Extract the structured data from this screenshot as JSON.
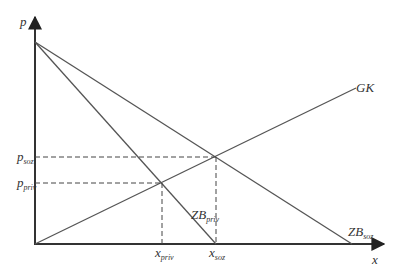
{
  "diagram": {
    "type": "supply-demand-externality",
    "colors": {
      "line": "#555555",
      "axis": "#333333",
      "dash": "#444444",
      "text": "#333333"
    },
    "axes": {
      "y": {
        "label": "p"
      },
      "x": {
        "label": "x"
      }
    },
    "curves": [
      {
        "id": "gk",
        "label": "GK",
        "description": "marginal cost / supply curve"
      },
      {
        "id": "zb_priv",
        "label": "ZB",
        "subscript": "priv",
        "description": "private marginal benefit"
      },
      {
        "id": "zb_soz",
        "label": "ZB",
        "subscript": "soz",
        "description": "social marginal benefit"
      }
    ],
    "y_ticks": [
      {
        "id": "p_soz",
        "label": "p",
        "subscript": "soz"
      },
      {
        "id": "p_priv",
        "label": "p",
        "subscript": "priv"
      }
    ],
    "x_ticks": [
      {
        "id": "x_priv",
        "label": "x",
        "subscript": "priv"
      },
      {
        "id": "x_soz",
        "label": "x",
        "subscript": "soz"
      }
    ],
    "equilibria": [
      {
        "id": "private",
        "of": [
          "gk",
          "zb_priv"
        ],
        "at": [
          "x_priv",
          "p_priv"
        ]
      },
      {
        "id": "social",
        "of": [
          "gk",
          "zb_soz"
        ],
        "at": [
          "x_soz",
          "p_soz"
        ]
      }
    ]
  }
}
